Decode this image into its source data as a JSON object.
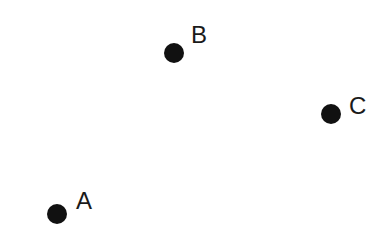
{
  "diagram": {
    "type": "labeled-points",
    "background": "#ffffff",
    "dot_color": "#111111",
    "label_color": "#1a1a1a",
    "points": [
      {
        "id": "A",
        "label": "A",
        "cx": 57,
        "cy": 214,
        "r": 10,
        "label_x": 76,
        "label_y": 189
      },
      {
        "id": "B",
        "label": "B",
        "cx": 174,
        "cy": 53,
        "r": 10,
        "label_x": 191,
        "label_y": 23
      },
      {
        "id": "C",
        "label": "C",
        "cx": 331,
        "cy": 114,
        "r": 10,
        "label_x": 349,
        "label_y": 94
      }
    ]
  }
}
